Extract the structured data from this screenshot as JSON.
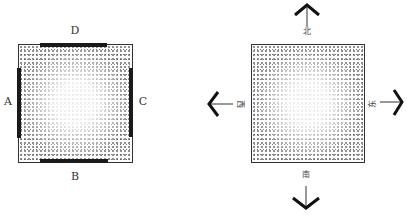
{
  "diagram_left": {
    "labels": {
      "top": "D",
      "bottom": "B",
      "left": "A",
      "right": "C"
    }
  },
  "diagram_right": {
    "labels": {
      "north": "北",
      "south": "南",
      "west": "西",
      "east": "东"
    },
    "arrows": [
      "north-arrow",
      "south-arrow",
      "west-arrow",
      "east-arrow"
    ]
  }
}
